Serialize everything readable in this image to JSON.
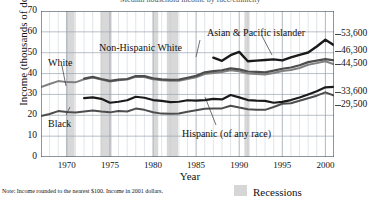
{
  "chart_data": {
    "type": "line",
    "title": "Median household income by race/ethnicity",
    "xlabel": "Year",
    "ylabel": "Income (thousands of dollars)",
    "xlim": [
      1967,
      2001
    ],
    "ylim": [
      0,
      70
    ],
    "ytick_labels": [
      "0",
      "10",
      "20",
      "30",
      "40",
      "50",
      "60",
      "70"
    ],
    "ytick_values": [
      0,
      10,
      20,
      30,
      40,
      50,
      60,
      70
    ],
    "xtick_labels": [
      "1970",
      "1975",
      "1980",
      "1985",
      "1990",
      "1995",
      "2000"
    ],
    "xtick_values": [
      1970,
      1975,
      1980,
      1985,
      1990,
      1995,
      2000
    ],
    "grid": true,
    "legend_position": "bottom-right",
    "note": "Note: Income rounded to the nearest $100. Income in 2001 dollars.",
    "legend": [
      {
        "label": "Recessions",
        "color": "#d6d6d6",
        "type": "band"
      }
    ],
    "end_value_labels": [
      {
        "text": "53,600",
        "series": "Asian & Pacific islander",
        "value": 53.6
      },
      {
        "text": "46,300",
        "series": "Non-Hispanic White",
        "value": 46.3
      },
      {
        "text": "44,500",
        "series": "White",
        "value": 44.5
      },
      {
        "text": "33,600",
        "series": "Black",
        "value": 33.6
      },
      {
        "text": "29,500",
        "series": "Hispanic (of any race)",
        "value": 29.5
      }
    ],
    "annotations": [
      {
        "text": "Asian & Pacific islander",
        "x": 207,
        "y": 27
      },
      {
        "text": "Non-Hispanic White",
        "x": 99,
        "y": 42
      },
      {
        "text": "White",
        "x": 48,
        "y": 57
      },
      {
        "text": "Black",
        "x": 48,
        "y": 118
      },
      {
        "text": "Hispanic (of any race)",
        "x": 182,
        "y": 128
      }
    ],
    "recessions": [
      {
        "start": 1969.9,
        "end": 1970.9
      },
      {
        "start": 1973.9,
        "end": 1975.2
      },
      {
        "start": 1980.0,
        "end": 1980.6
      },
      {
        "start": 1981.6,
        "end": 1982.9
      },
      {
        "start": 1990.6,
        "end": 1991.2
      },
      {
        "start": 2001.2,
        "end": 2001.9
      }
    ],
    "series": [
      {
        "name": "White",
        "color": "#808080",
        "width": 2.0,
        "x": [
          1967,
          1968,
          1969,
          1970,
          1971,
          1972,
          1973,
          1974,
          1975,
          1976,
          1977,
          1978,
          1979,
          1980,
          1981,
          1982,
          1983,
          1984,
          1985,
          1986,
          1987,
          1988,
          1989,
          1990,
          1991,
          1992,
          1993,
          1994,
          1995,
          1996,
          1997,
          1998,
          1999,
          2000,
          2001
        ],
        "values": [
          33.5,
          35.0,
          36.4,
          35.9,
          35.8,
          37.3,
          38.1,
          37.1,
          36.2,
          36.8,
          37.1,
          38.5,
          38.4,
          37.3,
          36.8,
          36.5,
          36.6,
          37.4,
          38.2,
          39.8,
          40.3,
          40.7,
          41.6,
          41.1,
          40.0,
          39.8,
          39.6,
          40.3,
          41.2,
          41.7,
          42.7,
          44.2,
          45.0,
          45.9,
          44.5
        ]
      },
      {
        "name": "Non-Hispanic White",
        "color": "#4d4d4d",
        "width": 2.2,
        "x": [
          1972,
          1973,
          1974,
          1975,
          1976,
          1977,
          1978,
          1979,
          1980,
          1981,
          1982,
          1983,
          1984,
          1985,
          1986,
          1987,
          1988,
          1989,
          1990,
          1991,
          1992,
          1993,
          1994,
          1995,
          1996,
          1997,
          1998,
          1999,
          2000,
          2001
        ],
        "values": [
          37.6,
          38.4,
          37.4,
          36.5,
          37.1,
          37.4,
          38.8,
          38.8,
          37.7,
          37.2,
          37.0,
          37.1,
          38.0,
          38.9,
          40.6,
          41.2,
          41.6,
          42.5,
          42.0,
          41.0,
          40.8,
          40.6,
          41.4,
          42.3,
          42.9,
          44.0,
          45.5,
          46.2,
          46.9,
          46.3
        ]
      },
      {
        "name": "Asian & Pacific islander",
        "color": "#1a1a1a",
        "width": 2.4,
        "x": [
          1987,
          1988,
          1989,
          1990,
          1991,
          1992,
          1993,
          1994,
          1995,
          1996,
          1997,
          1998,
          1999,
          2000,
          2001
        ],
        "values": [
          47.6,
          46.1,
          48.8,
          50.4,
          45.9,
          46.2,
          46.5,
          46.8,
          46.3,
          47.8,
          49.0,
          50.1,
          53.0,
          56.2,
          53.6
        ]
      },
      {
        "name": "Black",
        "color": "#4d4d4d",
        "width": 2.0,
        "x": [
          1967,
          1968,
          1969,
          1970,
          1971,
          1972,
          1973,
          1974,
          1975,
          1976,
          1977,
          1978,
          1979,
          1980,
          1981,
          1982,
          1983,
          1984,
          1985,
          1986,
          1987,
          1988,
          1989,
          1990,
          1991,
          1992,
          1993,
          1994,
          1995,
          1996,
          1997,
          1998,
          1999,
          2000,
          2001
        ],
        "values": [
          19.6,
          20.6,
          22.0,
          21.6,
          21.3,
          21.8,
          22.3,
          21.8,
          21.4,
          22.0,
          21.8,
          23.2,
          22.6,
          21.5,
          20.8,
          20.7,
          20.9,
          21.7,
          22.4,
          23.1,
          23.2,
          23.3,
          24.6,
          23.7,
          22.9,
          22.6,
          22.6,
          24.0,
          25.5,
          25.8,
          27.0,
          28.2,
          29.4,
          31.0,
          29.5
        ]
      },
      {
        "name": "Hispanic (of any race)",
        "color": "#1a1a1a",
        "width": 2.2,
        "x": [
          1972,
          1973,
          1974,
          1975,
          1976,
          1977,
          1978,
          1979,
          1980,
          1981,
          1982,
          1983,
          1984,
          1985,
          1986,
          1987,
          1988,
          1989,
          1990,
          1991,
          1992,
          1993,
          1994,
          1995,
          1996,
          1997,
          1998,
          1999,
          2000,
          2001
        ],
        "values": [
          28.2,
          28.6,
          27.9,
          26.0,
          26.5,
          27.2,
          28.9,
          28.4,
          27.3,
          26.9,
          26.3,
          26.5,
          27.2,
          27.0,
          27.3,
          27.9,
          27.6,
          29.7,
          28.6,
          27.3,
          27.0,
          26.9,
          26.0,
          26.4,
          27.3,
          28.5,
          30.0,
          31.5,
          33.4,
          33.6
        ]
      }
    ]
  },
  "axis": {
    "ylabel": "Income (thousands of dollars)",
    "xlabel": "Year"
  },
  "footer": {
    "note": "Note: Income rounded to the nearest $100. Income in 2001 dollars.",
    "legend_label": "Recessions"
  }
}
